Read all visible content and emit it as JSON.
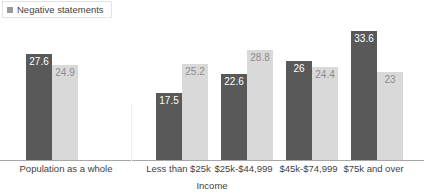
{
  "legend": {
    "entries": [
      {
        "label": "Negative statements",
        "swatch": "#9a9a9a",
        "icon": "legend-square-icon"
      }
    ]
  },
  "axis": {
    "xlabel": "Income"
  },
  "colors": {
    "series_dark": "#595959",
    "series_light": "#d9d9d9",
    "dark_label": "#ffffff",
    "light_label": "#8c8c8c",
    "axis_line": "#a6a6a6",
    "separator": "#ededed",
    "text": "#3f3f3f"
  },
  "chart_data": {
    "type": "bar",
    "title": "",
    "subtitle": "",
    "xlabel": "Income",
    "ylabel": "",
    "ylim": [
      0,
      36
    ],
    "grid": false,
    "legend_position": "top-left",
    "categories": [
      "Population as a whole",
      "Less than $25k",
      "$25k-$44,999",
      "$45k-$74,999",
      "$75k and over"
    ],
    "series": [
      {
        "name": "Negative statements",
        "color": "#595959",
        "values": [
          27.6,
          17.5,
          22.6,
          26,
          33.6
        ],
        "value_labels": [
          "27.6",
          "17.5",
          "22.6",
          "26",
          "33.6"
        ]
      },
      {
        "name": "",
        "color": "#d9d9d9",
        "values": [
          24.9,
          25.2,
          28.8,
          24.4,
          23
        ],
        "value_labels": [
          "24.9",
          "25.2",
          "28.8",
          "24.4",
          "23"
        ]
      }
    ],
    "annotations": [
      "Vertical separator between 'Population as a whole' and the income breakdown groups"
    ]
  },
  "layout": {
    "groups": [
      {
        "left": 26,
        "label_left": 0,
        "label_width": 132
      },
      {
        "left": 156,
        "label_left": 141,
        "label_width": 75
      },
      {
        "left": 221,
        "label_left": 206,
        "label_width": 75
      },
      {
        "left": 286,
        "label_left": 271,
        "label_width": 75
      },
      {
        "left": 351,
        "label_left": 336,
        "label_width": 75
      }
    ]
  }
}
